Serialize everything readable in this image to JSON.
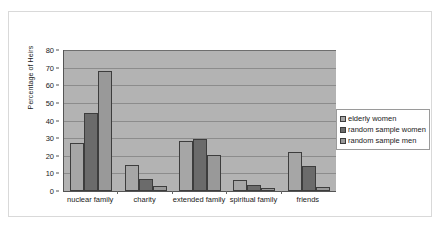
{
  "chart_data": {
    "type": "bar",
    "title": "",
    "xlabel": "",
    "ylabel": "Percentage of Heirs",
    "ylim": [
      0,
      80
    ],
    "ytick_step": 10,
    "yticks": [
      0,
      10,
      20,
      30,
      40,
      50,
      60,
      70,
      80
    ],
    "grid": true,
    "legend_position": "right",
    "categories": [
      "nuclear family",
      "charity",
      "extended family",
      "spiritual family",
      "friends"
    ],
    "series": [
      {
        "name": "elderly women",
        "color": "#a6a6a6",
        "values": [
          27,
          15,
          28.5,
          6,
          22
        ]
      },
      {
        "name": "random sample women",
        "color": "#6b6b6b",
        "values": [
          44,
          7,
          29.5,
          3.5,
          14
        ]
      },
      {
        "name": "random sample men",
        "color": "#999999",
        "values": [
          68,
          3,
          20.5,
          1.5,
          2.5
        ]
      }
    ],
    "plot_background": "#b3b3b3",
    "gridline_color": "#8c8c8c",
    "axis_color": "#555555",
    "frame_color": "#d9d9d9"
  }
}
